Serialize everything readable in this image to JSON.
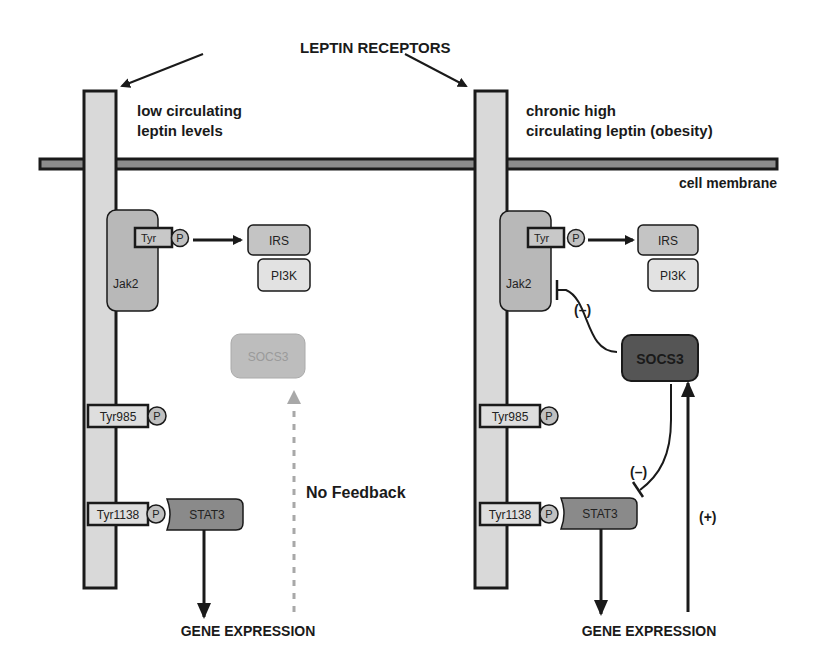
{
  "title": "LEPTIN RECEPTORS",
  "membrane_label": "cell membrane",
  "colors": {
    "receptor_fill": "#d9d9d9",
    "membrane_fill": "#8c8c8c",
    "jak2_fill": "#b8b8b8",
    "irs_fill": "#c4c4c4",
    "pi3k_fill": "#e2e2e2",
    "stat3_fill": "#8a8a8a",
    "socs3_inactive_fill": "#bdbdbd",
    "socs3_inactive_text": "#9a9a9a",
    "socs3_active_fill": "#555555",
    "dashed_arrow": "#a8a8a8",
    "stroke": "#1a1a1a"
  },
  "left_panel": {
    "condition_line1": "low circulating",
    "condition_line2": "leptin levels",
    "jak2": "Jak2",
    "tyr": "Tyr",
    "phospho": "P",
    "irs": "IRS",
    "pi3k": "PI3K",
    "socs3": "SOCS3",
    "tyr985": "Tyr985",
    "tyr1138": "Tyr1138",
    "stat3": "STAT3",
    "feedback_label": "No Feedback",
    "output": "GENE EXPRESSION"
  },
  "right_panel": {
    "condition_line1": "chronic high",
    "condition_line2": "circulating leptin (obesity)",
    "jak2": "Jak2",
    "tyr": "Tyr",
    "phospho": "P",
    "irs": "IRS",
    "pi3k": "PI3K",
    "socs3": "SOCS3",
    "tyr985": "Tyr985",
    "tyr1138": "Tyr1138",
    "stat3": "STAT3",
    "inhibit_jak2_label": "(–)",
    "inhibit_stat3_label": "(–)",
    "activate_label": "(+)",
    "output": "GENE EXPRESSION"
  }
}
